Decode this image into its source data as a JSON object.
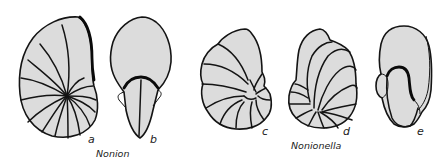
{
  "figure": {
    "groups": [
      {
        "genus": "Nonion",
        "views": [
          {
            "label": "a",
            "view": "side view, planispiral"
          },
          {
            "label": "b",
            "view": "apertural/edge view"
          }
        ]
      },
      {
        "genus": "Nonionella",
        "views": [
          {
            "label": "c",
            "view": "spiral side"
          },
          {
            "label": "d",
            "view": "umbilical side"
          },
          {
            "label": "e",
            "view": "edge view"
          }
        ]
      }
    ],
    "colors": {
      "fill": "#dcdcdc",
      "outline": "#141414",
      "background": "#ffffff"
    }
  }
}
